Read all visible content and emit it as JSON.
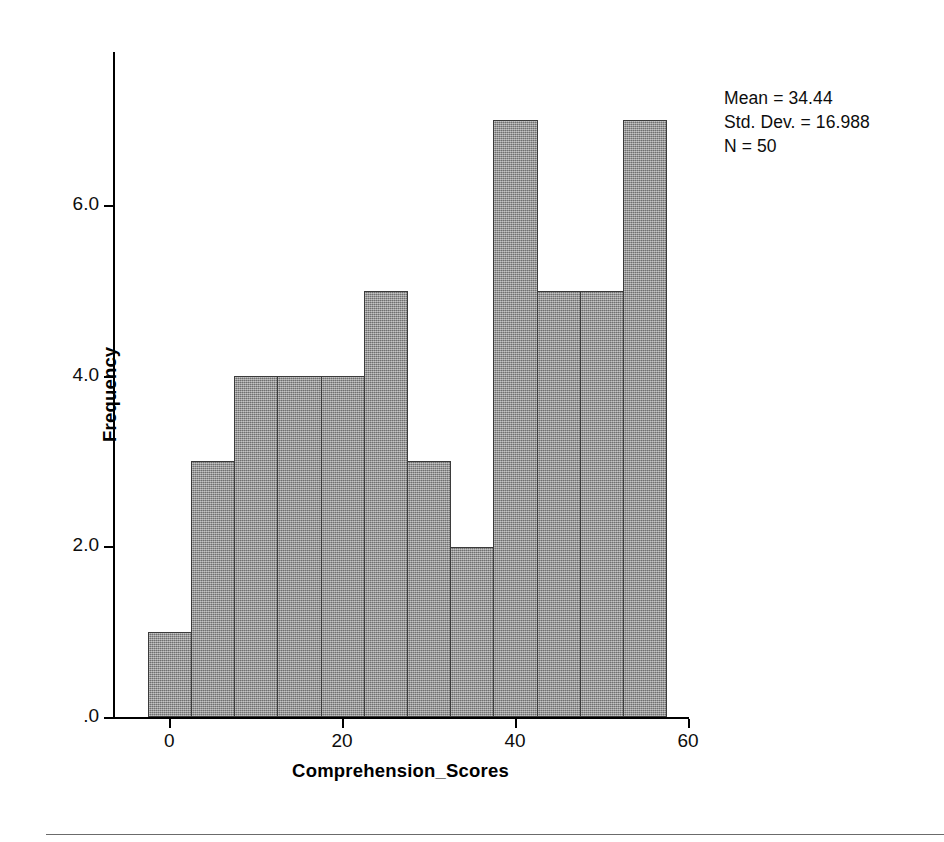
{
  "chart_data": {
    "type": "bar",
    "title": "",
    "subtitle": "",
    "xlabel": "Comprehension_Scores",
    "ylabel": "Frequency",
    "xlim": [
      -6.5,
      60
    ],
    "ylim": [
      0,
      7.8
    ],
    "grid": false,
    "legend_position": "top-right",
    "bin_width": 5,
    "categories": [
      "-2.5 to 2.5",
      "2.5 to 7.5",
      "7.5 to 12.5",
      "12.5 to 17.5",
      "17.5 to 22.5",
      "22.5 to 27.5",
      "27.5 to 32.5",
      "32.5 to 37.5",
      "37.5 to 42.5",
      "42.5 to 47.5",
      "47.5 to 52.5",
      "52.5 to 57.5"
    ],
    "bin_centers": [
      0,
      5,
      10,
      15,
      20,
      25,
      30,
      35,
      40,
      45,
      50,
      55
    ],
    "values": [
      1,
      3,
      4,
      4,
      4,
      5,
      3,
      2,
      7,
      5,
      5,
      7
    ],
    "xticks": [
      {
        "value": 0,
        "label": "0"
      },
      {
        "value": 20,
        "label": "20"
      },
      {
        "value": 40,
        "label": "40"
      },
      {
        "value": 60,
        "label": "60"
      }
    ],
    "yticks": [
      {
        "value": 0,
        "label": ".0"
      },
      {
        "value": 2,
        "label": "2.0"
      },
      {
        "value": 4,
        "label": "4.0"
      },
      {
        "value": 6,
        "label": "6.0"
      }
    ],
    "annotations": {
      "mean_label": "Mean = 34.44",
      "std_dev_label": "Std. Dev. = 16.988",
      "n_label": "N = 50"
    },
    "colors": {
      "bar_fill": "#8d8d8d",
      "bar_border": "#3b3b3b",
      "axis": "#000000",
      "text": "#0d0d0d",
      "background": "#ffffff",
      "rule": "#6b6b6b"
    }
  }
}
